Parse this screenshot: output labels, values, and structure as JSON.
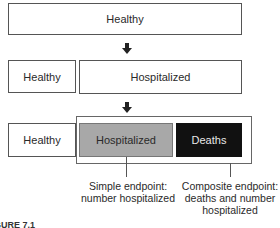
{
  "diagram": {
    "row1": {
      "healthy": "Healthy"
    },
    "row2": {
      "healthy": "Healthy",
      "hospitalized": "Hospitalized"
    },
    "row3": {
      "healthy": "Healthy",
      "hospitalized": "Hospitalized",
      "deaths": "Deaths"
    },
    "labels": {
      "simple": [
        "Simple endpoint:",
        "number hospitalized"
      ],
      "composite": [
        "Composite endpoint:",
        "deaths and number",
        "hospitalized"
      ]
    },
    "caption": "FIGURE 7.1"
  },
  "colors": {
    "hospitalized_fill": "#a8a8a8",
    "deaths_fill": "#111111",
    "deaths_text": "#e8e8e8",
    "border": "#555555"
  }
}
